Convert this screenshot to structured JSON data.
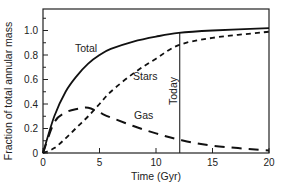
{
  "chart_data": {
    "type": "line",
    "title": "",
    "xlabel": "Time (Gyr)",
    "ylabel": "Fraction of total annular mass",
    "xlim": [
      0,
      20
    ],
    "ylim": [
      0,
      1.17
    ],
    "xticks": [
      0,
      5,
      10,
      15,
      20
    ],
    "yticks": [
      0,
      0.2,
      0.4,
      0.6,
      0.8,
      1.0
    ],
    "ytick_labels": [
      "0",
      "0.2",
      "0.4",
      "0.6",
      "0.8",
      "1.0"
    ],
    "xtick_labels": [
      "0",
      "5",
      "10",
      "15",
      "20"
    ],
    "grid": false,
    "legend": "inline labels",
    "x": [
      0,
      1,
      2,
      3,
      4,
      5,
      6,
      8,
      10,
      12,
      15,
      20
    ],
    "series": [
      {
        "name": "Total",
        "style": "solid",
        "values": [
          0,
          0.3,
          0.5,
          0.63,
          0.73,
          0.8,
          0.85,
          0.91,
          0.95,
          0.98,
          1.0,
          1.02
        ]
      },
      {
        "name": "Stars",
        "style": "short-dash",
        "values": [
          0,
          0.04,
          0.12,
          0.21,
          0.3,
          0.4,
          0.5,
          0.65,
          0.77,
          0.88,
          0.94,
          0.99
        ]
      },
      {
        "name": "Gas",
        "style": "long-dash",
        "values": [
          0,
          0.25,
          0.33,
          0.36,
          0.37,
          0.33,
          0.29,
          0.22,
          0.16,
          0.11,
          0.06,
          0.02
        ]
      }
    ],
    "annotations": [
      {
        "type": "vline",
        "x": 12.1,
        "label": "Today"
      }
    ]
  },
  "labels": {
    "total": "Total",
    "stars": "Stars",
    "gas": "Gas",
    "today": "Today",
    "xlabel": "Time (Gyr)",
    "ylabel": "Fraction of total annular mass",
    "yticks": [
      "0",
      "0.2",
      "0.4",
      "0.6",
      "0.8",
      "1.0"
    ],
    "xticks": [
      "0",
      "5",
      "10",
      "15",
      "20"
    ]
  }
}
